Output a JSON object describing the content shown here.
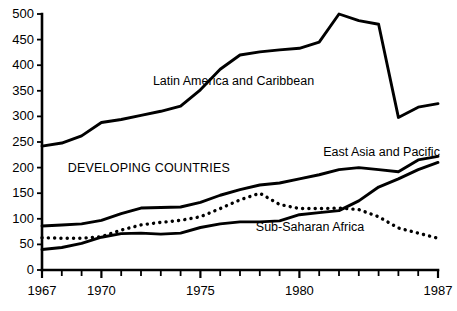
{
  "chart_data": {
    "type": "line",
    "title": "",
    "subtitle": "",
    "xlabel": "",
    "ylabel": "",
    "xlim": [
      1967,
      1987
    ],
    "ylim": [
      0,
      500
    ],
    "grid": false,
    "legend_position": "inline-annotations",
    "x": [
      1967,
      1968,
      1969,
      1970,
      1971,
      1972,
      1973,
      1974,
      1975,
      1976,
      1977,
      1978,
      1979,
      1980,
      1981,
      1982,
      1983,
      1984,
      1985,
      1986,
      1987
    ],
    "x_tick_labels": [
      "1967",
      "1970",
      "1975",
      "1980",
      "1987"
    ],
    "x_ticks_all": [
      1967,
      1968,
      1969,
      1970,
      1971,
      1972,
      1973,
      1974,
      1975,
      1976,
      1977,
      1978,
      1979,
      1980,
      1981,
      1982,
      1983,
      1984,
      1985,
      1986,
      1987
    ],
    "y_tick_labels": [
      "0",
      "50",
      "100",
      "150",
      "200",
      "250",
      "300",
      "350",
      "400",
      "450",
      "500"
    ],
    "y_ticks": [
      0,
      50,
      100,
      150,
      200,
      250,
      300,
      350,
      400,
      450,
      500
    ],
    "series": [
      {
        "name": "Latin America and Caribbean",
        "style": "solid",
        "label_x": 1972.6,
        "label_y": 368,
        "values": [
          242,
          248,
          262,
          288,
          294,
          302,
          310,
          320,
          352,
          392,
          420,
          426,
          430,
          433,
          445,
          500,
          487,
          480,
          298,
          318,
          325
        ]
      },
      {
        "name": "DEVELOPING COUNTRIES",
        "style": "solid",
        "label_x": 1968.3,
        "label_y": 198,
        "values": [
          86,
          88,
          90,
          97,
          110,
          121,
          122,
          123,
          132,
          146,
          157,
          166,
          170,
          178,
          186,
          196,
          200,
          196,
          192,
          215,
          222
        ]
      },
      {
        "name": "East Asia and Pacific",
        "style": "solid",
        "label_x": 1981.2,
        "label_y": 228,
        "values": [
          40,
          44,
          52,
          64,
          71,
          72,
          70,
          72,
          83,
          90,
          94,
          94,
          96,
          108,
          112,
          116,
          135,
          162,
          178,
          196,
          210
        ]
      },
      {
        "name": "Sub-Saharan Africa",
        "style": "dotted",
        "label_x": 1977.8,
        "label_y": 82,
        "values": [
          63,
          62,
          62,
          65,
          78,
          88,
          93,
          97,
          104,
          120,
          137,
          150,
          128,
          120,
          120,
          121,
          118,
          104,
          82,
          72,
          62
        ]
      }
    ],
    "annotations": [
      {
        "name": "latin-america-label",
        "text": "Latin America and Caribbean"
      },
      {
        "name": "developing-countries-label",
        "text": "DEVELOPING COUNTRIES"
      },
      {
        "name": "east-asia-label",
        "text": "East Asia and Pacific"
      },
      {
        "name": "sub-saharan-africa-label",
        "text": "Sub-Saharan Africa"
      }
    ],
    "colors": {
      "line": "#000000",
      "axis": "#000000",
      "background": "#ffffff"
    }
  },
  "axes": {
    "y_labels": [
      "500",
      "450",
      "400",
      "350",
      "300",
      "250",
      "200",
      "150",
      "100",
      "50",
      "0"
    ],
    "x_labels": [
      "1967",
      "1970",
      "1975",
      "1980",
      "1987"
    ]
  },
  "labels": {
    "latin_america": "Latin America and Caribbean",
    "developing_countries": "DEVELOPING COUNTRIES",
    "east_asia": "East Asia and Pacific",
    "sub_saharan": "Sub-Saharan Africa"
  }
}
